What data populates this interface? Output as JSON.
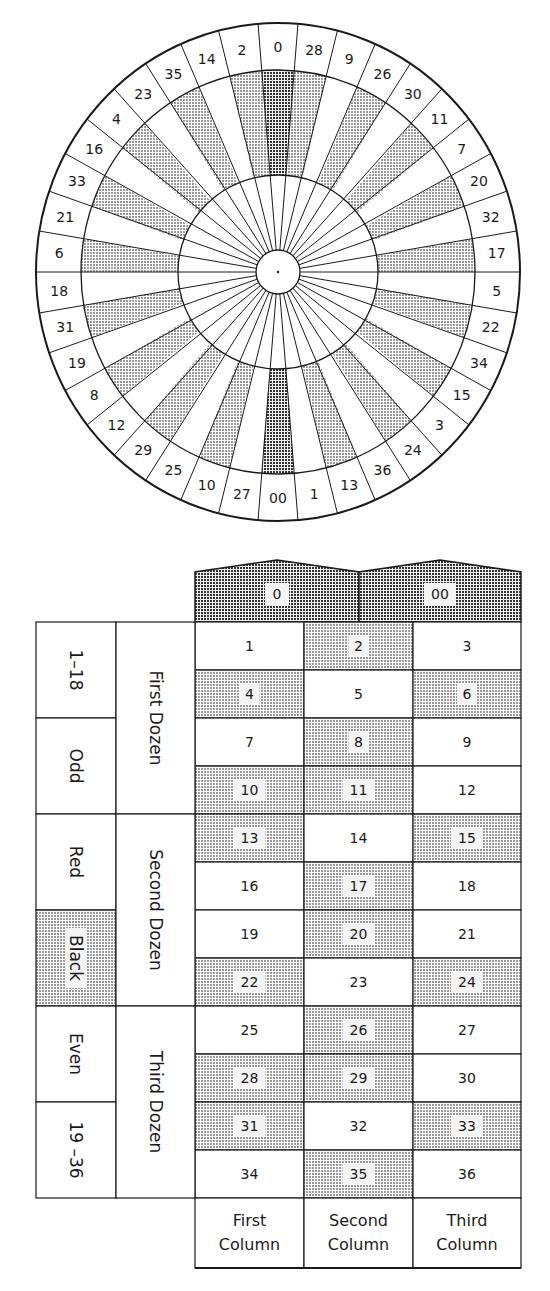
{
  "wheel": {
    "order": [
      "0",
      "28",
      "9",
      "26",
      "30",
      "11",
      "7",
      "20",
      "32",
      "17",
      "5",
      "22",
      "34",
      "15",
      "3",
      "24",
      "36",
      "13",
      "1",
      "00",
      "27",
      "10",
      "25",
      "29",
      "12",
      "8",
      "19",
      "31",
      "18",
      "6",
      "21",
      "33",
      "16",
      "4",
      "23",
      "35",
      "14",
      "2"
    ],
    "black_numbers": [
      "2",
      "4",
      "6",
      "8",
      "10",
      "11",
      "13",
      "15",
      "17",
      "20",
      "22",
      "24",
      "26",
      "28",
      "29",
      "31",
      "33",
      "35"
    ],
    "green_numbers": [
      "0",
      "00"
    ]
  },
  "table": {
    "zeros": [
      "0",
      "00"
    ],
    "rows": [
      [
        "1",
        "2",
        "3"
      ],
      [
        "4",
        "5",
        "6"
      ],
      [
        "7",
        "8",
        "9"
      ],
      [
        "10",
        "11",
        "12"
      ],
      [
        "13",
        "14",
        "15"
      ],
      [
        "16",
        "17",
        "18"
      ],
      [
        "19",
        "20",
        "21"
      ],
      [
        "22",
        "23",
        "24"
      ],
      [
        "25",
        "26",
        "27"
      ],
      [
        "28",
        "29",
        "30"
      ],
      [
        "31",
        "32",
        "33"
      ],
      [
        "34",
        "35",
        "36"
      ]
    ],
    "outside_bets": [
      "1–18",
      "Odd",
      "Red",
      "Black",
      "Even",
      "19 –36"
    ],
    "dozens": [
      "First Dozen",
      "Second Dozen",
      "Third Dozen"
    ],
    "columns": [
      {
        "line1": "First",
        "line2": "Column"
      },
      {
        "line1": "Second",
        "line2": "Column"
      },
      {
        "line1": "Third",
        "line2": "Column"
      }
    ]
  },
  "colors": {
    "line": "#1a1a1a",
    "black_shade": "#bdbdbd",
    "green_shade": "#6e6e6e",
    "background": "#ffffff"
  }
}
